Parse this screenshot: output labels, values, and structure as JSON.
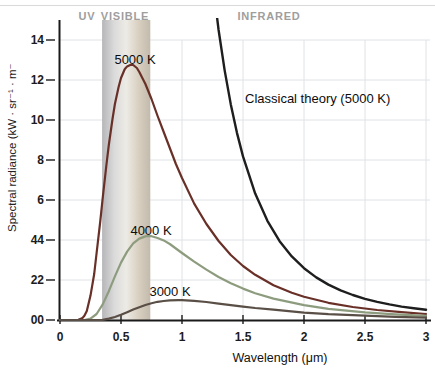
{
  "chart_data": {
    "type": "line",
    "title": "",
    "xlabel": "Wavelength (μm)",
    "ylabel": "Spectral radiance (kW · sr⁻¹ · m⁻",
    "xlim": [
      0,
      3
    ],
    "ylim": [
      0,
      14
    ],
    "grid": true,
    "legend_position": "none",
    "xticks": [
      {
        "value": 0,
        "label": "0"
      },
      {
        "value": 0.5,
        "label": "0.5"
      },
      {
        "value": 1,
        "label": "1"
      },
      {
        "value": 1.5,
        "label": "1.5"
      },
      {
        "value": 2,
        "label": "2"
      },
      {
        "value": 2.5,
        "label": "2.5"
      },
      {
        "value": 3,
        "label": "3"
      }
    ],
    "yticks": [
      {
        "value": 0,
        "label": "00"
      },
      {
        "value": 2,
        "label": "22"
      },
      {
        "value": 4,
        "label": "44"
      },
      {
        "value": 6,
        "label": "6"
      },
      {
        "value": 8,
        "label": "8"
      },
      {
        "value": 10,
        "label": "10"
      },
      {
        "value": 12,
        "label": "12"
      },
      {
        "value": 14,
        "label": "14"
      }
    ],
    "regions": {
      "uv_label": "UV",
      "visible_label": "VISIBLE",
      "infrared_label": "INFRARED",
      "visible_band_um": [
        0.345,
        0.74
      ],
      "band_gradient": [
        "#b6b6b9",
        "#dadada",
        "#edebe5",
        "#d9d0c1",
        "#c2baac"
      ]
    },
    "series": [
      {
        "name": "5000 K",
        "color": "#693028",
        "width": 2.2,
        "points": [
          [
            0,
            0
          ],
          [
            0.12,
            0
          ],
          [
            0.15,
            0.01
          ],
          [
            0.18,
            0.08
          ],
          [
            0.2,
            0.21
          ],
          [
            0.22,
            0.45
          ],
          [
            0.25,
            1.22
          ],
          [
            0.28,
            2.3
          ],
          [
            0.3,
            3.35
          ],
          [
            0.33,
            4.95
          ],
          [
            0.35,
            6.1
          ],
          [
            0.38,
            7.75
          ],
          [
            0.4,
            8.75
          ],
          [
            0.43,
            10.05
          ],
          [
            0.45,
            10.8
          ],
          [
            0.48,
            11.65
          ],
          [
            0.5,
            12.1
          ],
          [
            0.53,
            12.54
          ],
          [
            0.55,
            12.68
          ],
          [
            0.58,
            12.76
          ],
          [
            0.6,
            12.75
          ],
          [
            0.63,
            12.6
          ],
          [
            0.65,
            12.4
          ],
          [
            0.7,
            11.8
          ],
          [
            0.75,
            11.05
          ],
          [
            0.8,
            10.2
          ],
          [
            0.85,
            9.4
          ],
          [
            0.9,
            8.6
          ],
          [
            0.95,
            7.8
          ],
          [
            1.0,
            7.1
          ],
          [
            1.1,
            5.82
          ],
          [
            1.2,
            4.8
          ],
          [
            1.3,
            3.95
          ],
          [
            1.4,
            3.25
          ],
          [
            1.5,
            2.7
          ],
          [
            1.6,
            2.26
          ],
          [
            1.75,
            1.74
          ],
          [
            1.9,
            1.36
          ],
          [
            2.0,
            1.16
          ],
          [
            2.2,
            0.86
          ],
          [
            2.4,
            0.65
          ],
          [
            2.6,
            0.5
          ],
          [
            2.8,
            0.39
          ],
          [
            3.0,
            0.3
          ]
        ]
      },
      {
        "name": "4000 K",
        "color": "#8d9c7e",
        "width": 2.2,
        "points": [
          [
            0,
            0
          ],
          [
            0.2,
            0
          ],
          [
            0.25,
            0.07
          ],
          [
            0.3,
            0.3
          ],
          [
            0.35,
            0.78
          ],
          [
            0.4,
            1.44
          ],
          [
            0.45,
            2.18
          ],
          [
            0.5,
            2.87
          ],
          [
            0.55,
            3.42
          ],
          [
            0.6,
            3.83
          ],
          [
            0.65,
            4.07
          ],
          [
            0.7,
            4.18
          ],
          [
            0.72,
            4.2
          ],
          [
            0.75,
            4.19
          ],
          [
            0.8,
            4.1
          ],
          [
            0.85,
            3.98
          ],
          [
            0.9,
            3.8
          ],
          [
            1.0,
            3.35
          ],
          [
            1.1,
            2.92
          ],
          [
            1.2,
            2.52
          ],
          [
            1.3,
            2.15
          ],
          [
            1.4,
            1.84
          ],
          [
            1.5,
            1.57
          ],
          [
            1.6,
            1.34
          ],
          [
            1.75,
            1.07
          ],
          [
            2.0,
            0.74
          ],
          [
            2.2,
            0.56
          ],
          [
            2.5,
            0.38
          ],
          [
            2.75,
            0.28
          ],
          [
            3.0,
            0.21
          ]
        ]
      },
      {
        "name": "3000 K",
        "color": "#5a4f46",
        "width": 2.2,
        "points": [
          [
            0,
            0
          ],
          [
            0.3,
            0
          ],
          [
            0.35,
            0.01
          ],
          [
            0.4,
            0.07
          ],
          [
            0.45,
            0.15
          ],
          [
            0.5,
            0.26
          ],
          [
            0.55,
            0.39
          ],
          [
            0.6,
            0.52
          ],
          [
            0.65,
            0.64
          ],
          [
            0.7,
            0.75
          ],
          [
            0.75,
            0.84
          ],
          [
            0.8,
            0.91
          ],
          [
            0.85,
            0.95
          ],
          [
            0.9,
            0.98
          ],
          [
            0.97,
            0.99
          ],
          [
            1.0,
            0.99
          ],
          [
            1.1,
            0.96
          ],
          [
            1.2,
            0.9
          ],
          [
            1.3,
            0.82
          ],
          [
            1.4,
            0.74
          ],
          [
            1.5,
            0.67
          ],
          [
            1.6,
            0.6
          ],
          [
            1.75,
            0.52
          ],
          [
            2.0,
            0.37
          ],
          [
            2.2,
            0.29
          ],
          [
            2.5,
            0.22
          ],
          [
            2.75,
            0.16
          ],
          [
            3.0,
            0.12
          ]
        ]
      },
      {
        "name": "Classical theory (5000 K)",
        "color": "#1e1e1e",
        "width": 2.4,
        "points": [
          [
            1.2,
            19.97
          ],
          [
            1.25,
            16.96
          ],
          [
            1.3,
            14.5
          ],
          [
            1.35,
            12.47
          ],
          [
            1.4,
            10.78
          ],
          [
            1.45,
            9.37
          ],
          [
            1.5,
            8.18
          ],
          [
            1.6,
            6.32
          ],
          [
            1.7,
            4.96
          ],
          [
            1.8,
            3.94
          ],
          [
            1.9,
            3.18
          ],
          [
            2.0,
            2.59
          ],
          [
            2.1,
            2.13
          ],
          [
            2.2,
            1.77
          ],
          [
            2.3,
            1.48
          ],
          [
            2.4,
            1.25
          ],
          [
            2.5,
            1.06
          ],
          [
            2.6,
            0.91
          ],
          [
            2.7,
            0.78
          ],
          [
            2.8,
            0.67
          ],
          [
            2.9,
            0.585
          ],
          [
            3.0,
            0.51
          ]
        ]
      }
    ]
  }
}
